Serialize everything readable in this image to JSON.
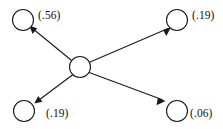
{
  "diagram": {
    "type": "path-diagram",
    "stroke_color": "#1a1a1a",
    "background_color": "#ffffff",
    "center_node": {
      "id": "center",
      "label": "",
      "cx": 80,
      "cy": 67,
      "r": 10.5
    },
    "nodes": [
      {
        "id": "top-left",
        "value_label": "(.56)",
        "cx": 23,
        "cy": 20,
        "r": 10.5,
        "label_x": 38,
        "label_y": 19
      },
      {
        "id": "top-right",
        "value_label": "(.19)",
        "cx": 177,
        "cy": 20,
        "r": 10.5,
        "label_x": 192,
        "label_y": 19
      },
      {
        "id": "bottom-left",
        "value_label": "(.19)",
        "cx": 24,
        "cy": 111,
        "r": 10.5,
        "label_x": 46,
        "label_y": 117
      },
      {
        "id": "bottom-right",
        "value_label": "(.06)",
        "cx": 177,
        "cy": 111,
        "r": 10.5,
        "label_x": 190,
        "label_y": 117
      }
    ],
    "edges": [
      {
        "id": "center-to-top-left",
        "from": "center",
        "to": "top-left",
        "directed": true
      },
      {
        "id": "center-to-top-right",
        "from": "center",
        "to": "top-right",
        "directed": true
      },
      {
        "id": "center-to-bottom-left",
        "from": "center",
        "to": "bottom-left",
        "directed": true
      },
      {
        "id": "center-to-bottom-right",
        "from": "center",
        "to": "bottom-right",
        "directed": true
      }
    ]
  }
}
